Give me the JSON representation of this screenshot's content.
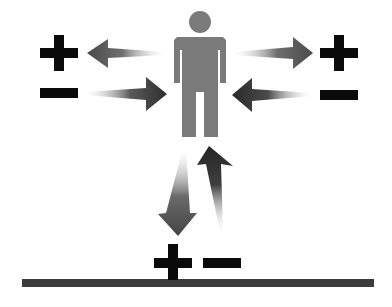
{
  "diagram": {
    "figure": {
      "icon": "person-icon",
      "color": "#7a7a7a"
    },
    "symbols": {
      "left_plus": "+",
      "left_minus": "−",
      "right_plus": "+",
      "right_minus": "−",
      "bottom_plus": "+",
      "bottom_minus": "−"
    },
    "arrows": [
      {
        "name": "arrow-person-to-left-plus",
        "direction": "left",
        "from": "person",
        "to": "left-plus"
      },
      {
        "name": "arrow-left-minus-to-person",
        "direction": "right",
        "from": "left-minus",
        "to": "person"
      },
      {
        "name": "arrow-person-to-right-plus",
        "direction": "right",
        "from": "person",
        "to": "right-plus"
      },
      {
        "name": "arrow-right-minus-to-person",
        "direction": "left",
        "from": "right-minus",
        "to": "person"
      },
      {
        "name": "arrow-person-to-ground",
        "direction": "down",
        "from": "person",
        "to": "ground-plus"
      },
      {
        "name": "arrow-ground-to-person",
        "direction": "up",
        "from": "ground-minus",
        "to": "person"
      }
    ],
    "colors": {
      "symbol": "#0a0a0a",
      "arrow_dark": "#3a3a3a",
      "arrow_light": "#ffffff",
      "ground": "#3c3c3c"
    }
  }
}
